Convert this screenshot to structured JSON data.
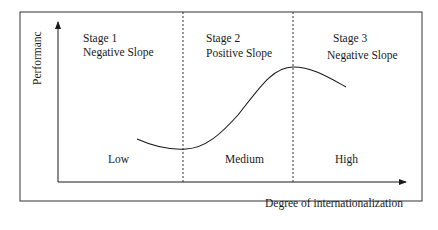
{
  "diagram": {
    "type": "stage-curve",
    "y_axis_label": "Performanc",
    "x_axis_label": "Degree of internationalization",
    "stages": [
      {
        "title": "Stage 1",
        "slope": "Negative Slope",
        "level": "Low"
      },
      {
        "title": "Stage 2",
        "slope": "Positive Slope",
        "level": "Medium"
      },
      {
        "title": "Stage 3",
        "slope": "Negative Slope",
        "level": "High"
      }
    ],
    "colors": {
      "line": "#1a1a1a",
      "background": "#ffffff"
    }
  }
}
